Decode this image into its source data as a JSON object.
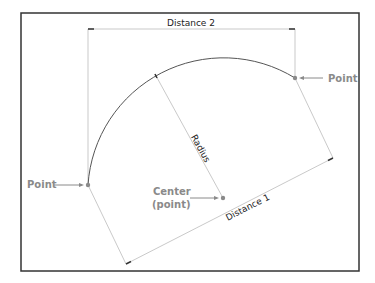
{
  "diagram": {
    "frame": {
      "x": 21,
      "y": 13,
      "width": 338,
      "height": 258
    },
    "dimensions": {
      "distance_2": "Distance 2",
      "distance_1": "Distance 1",
      "radius": "Radius"
    },
    "labels": {
      "point_left": "Point",
      "point_right": "Point",
      "center_line1": "Center",
      "center_line2": "(point)"
    },
    "points": {
      "left": [
        88,
        185
      ],
      "right": [
        295,
        78
      ],
      "center": [
        223,
        198
      ]
    },
    "colors": {
      "label": "#8a8a8a",
      "arc": "#555555",
      "dimension_line": "#aaaaaa",
      "frame": "#333333"
    }
  }
}
